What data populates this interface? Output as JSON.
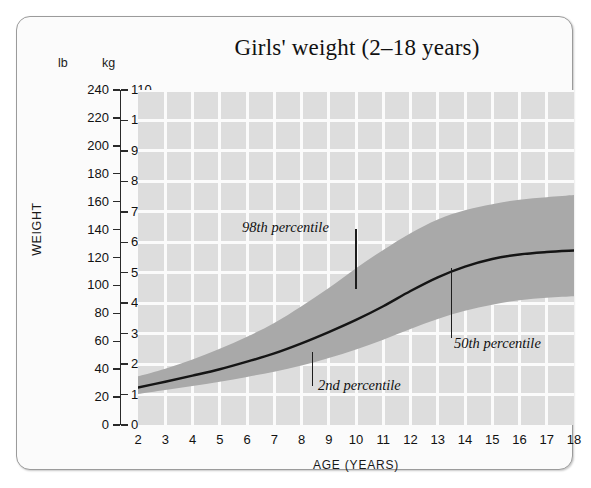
{
  "chart_data": {
    "type": "area",
    "title": "Girls' weight (2–18 years)",
    "xlabel": "AGE (YEARS)",
    "ylabel": "WEIGHT",
    "grid": true,
    "legend": "none",
    "x": [
      2,
      3,
      4,
      5,
      6,
      7,
      8,
      9,
      10,
      11,
      12,
      13,
      14,
      15,
      16,
      17,
      18
    ],
    "xlim": [
      2,
      18
    ],
    "x_tick_labels": [
      "2",
      "3",
      "4",
      "5",
      "6",
      "7",
      "8",
      "9",
      "10",
      "11",
      "12",
      "13",
      "14",
      "15",
      "16",
      "17",
      "18"
    ],
    "y_axes": [
      {
        "unit": "lb",
        "ylim": [
          0,
          240
        ],
        "ticks": [
          0,
          20,
          40,
          60,
          80,
          100,
          120,
          140,
          160,
          180,
          200,
          220,
          240
        ],
        "tick_labels": [
          "0",
          "20",
          "40",
          "60",
          "80",
          "100",
          "120",
          "140",
          "160",
          "180",
          "200",
          "220",
          "240"
        ]
      },
      {
        "unit": "kg",
        "ylim": [
          0,
          110
        ],
        "ticks": [
          0,
          10,
          20,
          30,
          40,
          50,
          60,
          70,
          80,
          90,
          100,
          110
        ],
        "tick_labels": [
          "0",
          "10",
          "20",
          "30",
          "40",
          "50",
          "60",
          "70",
          "80",
          "90",
          "100",
          "110"
        ]
      }
    ],
    "series": [
      {
        "name": "98th percentile",
        "unit": "kg",
        "values": [
          16.0,
          18.5,
          21.5,
          25.0,
          29.0,
          33.5,
          39.0,
          45.0,
          51.5,
          57.5,
          63.0,
          67.5,
          70.5,
          72.5,
          74.0,
          74.8,
          75.5
        ]
      },
      {
        "name": "50th percentile",
        "unit": "kg",
        "values": [
          12.3,
          14.2,
          16.2,
          18.3,
          20.8,
          23.5,
          26.8,
          30.5,
          34.5,
          39.0,
          44.0,
          48.5,
          52.0,
          54.5,
          56.0,
          56.8,
          57.3
        ]
      },
      {
        "name": "2nd percentile",
        "unit": "kg",
        "values": [
          10.2,
          11.5,
          12.8,
          14.2,
          15.8,
          17.5,
          19.5,
          22.0,
          24.8,
          28.0,
          31.5,
          34.8,
          37.5,
          39.5,
          41.0,
          41.8,
          42.3
        ]
      }
    ],
    "annotations": [
      {
        "text": "98th percentile",
        "target_age": 10.0,
        "target_kg": 51.5
      },
      {
        "text": "50th percentile",
        "target_age": 13.5,
        "target_kg": 50.0
      },
      {
        "text": "2nd percentile",
        "target_age": 8.4,
        "target_kg": 19.5
      }
    ]
  },
  "colors": {
    "plot_background": "#dddddd",
    "band_fill": "#a9a9a9",
    "gridline": "#fbfbfb",
    "median_line": "#151515",
    "card_background": "#fbfbfb",
    "card_border": "#9b9b9b",
    "text": "#111111"
  }
}
